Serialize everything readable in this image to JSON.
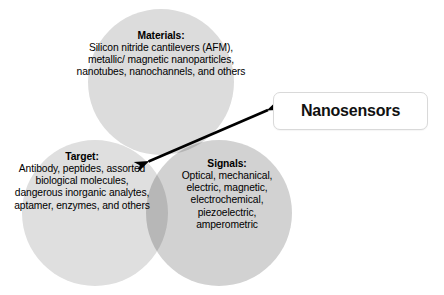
{
  "figure": {
    "type": "venn-diagram",
    "background_color": "#ffffff",
    "circle_count": 3
  },
  "venn": {
    "circles": [
      {
        "id": "materials",
        "title": "Materials:",
        "body": "Silicon nitride cantilevers (AFM), metallic/ magnetic nanoparticles, nanotubes, nanochannels, and others",
        "fill_color": "#dcdcdc"
      },
      {
        "id": "target",
        "title": "Target:",
        "body": "Antibody, peptides, assorted biological molecules, dangerous inorganic analytes, aptamer, enzymes, and others",
        "fill_color": "#dfdfdf"
      },
      {
        "id": "signals",
        "title": "Signals:",
        "body": "Optical, mechanical, electric, magnetic, electrochemical, piezoelectric, amperometric",
        "fill_color": "#d2d2d2"
      }
    ],
    "overlap_color": "#bdbdbd"
  },
  "callout": {
    "label": "Nanosensors",
    "border_color": "#d9d9d9",
    "background_color": "#ffffff",
    "text_color": "#111111"
  },
  "arrow": {
    "name": "double-headed-arrow",
    "color": "#000000",
    "from_label": "intersection of all three circles",
    "to_label": "Nanosensors"
  }
}
